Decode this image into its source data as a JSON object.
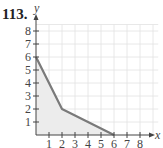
{
  "problem": {
    "number": "113."
  },
  "chart_data": {
    "type": "area",
    "title": "",
    "xlabel": "x",
    "ylabel": "y",
    "xlim": [
      0,
      8.5
    ],
    "ylim": [
      0,
      8.5
    ],
    "grid": true,
    "x_ticks": [
      "1",
      "2",
      "3",
      "4",
      "5",
      "6",
      "7",
      "8"
    ],
    "y_ticks": [
      "1",
      "2",
      "3",
      "4",
      "5",
      "6",
      "7",
      "8"
    ],
    "series": [
      {
        "name": "boundary",
        "points": [
          [
            0,
            6
          ],
          [
            2,
            2
          ],
          [
            6,
            0
          ]
        ]
      }
    ],
    "shaded_region": [
      [
        0,
        0
      ],
      [
        0,
        6
      ],
      [
        2,
        2
      ],
      [
        6,
        0
      ]
    ],
    "colors": {
      "line": "#7a7a7a",
      "fill": "#ececec",
      "grid": "#e2e2e2",
      "axis": "#444444"
    }
  }
}
